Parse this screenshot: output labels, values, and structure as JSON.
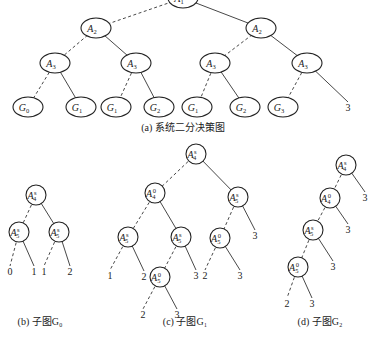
{
  "figure_a": {
    "caption": "(a) 系统二分决策图",
    "nodes": [
      {
        "id": "a_root",
        "var": "A",
        "sub": "1",
        "x": 183,
        "y": -2,
        "rx": 15,
        "ry": 10
      },
      {
        "id": "a_l",
        "var": "A",
        "sub": "2",
        "x": 96,
        "y": 28,
        "rx": 15,
        "ry": 10
      },
      {
        "id": "a_r",
        "var": "A",
        "sub": "2",
        "x": 261,
        "y": 28,
        "rx": 15,
        "ry": 10
      },
      {
        "id": "a_ll",
        "var": "A",
        "sub": "3",
        "x": 55,
        "y": 63,
        "rx": 15,
        "ry": 10
      },
      {
        "id": "a_lr",
        "var": "A",
        "sub": "3",
        "x": 136,
        "y": 63,
        "rx": 15,
        "ry": 10
      },
      {
        "id": "a_rl",
        "var": "A",
        "sub": "3",
        "x": 215,
        "y": 63,
        "rx": 15,
        "ry": 10
      },
      {
        "id": "a_rr",
        "var": "A",
        "sub": "3",
        "x": 307,
        "y": 63,
        "rx": 15,
        "ry": 10
      },
      {
        "id": "g1",
        "var": "G",
        "sub": "0",
        "x": 28,
        "y": 107,
        "rx": 15,
        "ry": 10
      },
      {
        "id": "g2",
        "var": "G",
        "sub": "1",
        "x": 81,
        "y": 107,
        "rx": 15,
        "ry": 10
      },
      {
        "id": "g3",
        "var": "G",
        "sub": "1",
        "x": 116,
        "y": 107,
        "rx": 15,
        "ry": 10
      },
      {
        "id": "g4",
        "var": "G",
        "sub": "2",
        "x": 159,
        "y": 107,
        "rx": 15,
        "ry": 10
      },
      {
        "id": "g5",
        "var": "G",
        "sub": "1",
        "x": 197,
        "y": 107,
        "rx": 15,
        "ry": 10
      },
      {
        "id": "g6",
        "var": "G",
        "sub": "2",
        "x": 245,
        "y": 107,
        "rx": 15,
        "ry": 10
      },
      {
        "id": "g7",
        "var": "G",
        "sub": "3",
        "x": 283,
        "y": 107,
        "rx": 15,
        "ry": 10
      }
    ],
    "leaves": [
      {
        "id": "a_t1",
        "text": "3",
        "x": 348,
        "y": 111
      }
    ],
    "edges": [
      {
        "from": "a_root",
        "to": "a_l",
        "style": "dashed"
      },
      {
        "from": "a_root",
        "to": "a_r",
        "style": "solid"
      },
      {
        "from": "a_l",
        "to": "a_ll",
        "style": "dashed"
      },
      {
        "from": "a_l",
        "to": "a_lr",
        "style": "solid"
      },
      {
        "from": "a_r",
        "to": "a_rl",
        "style": "dashed"
      },
      {
        "from": "a_r",
        "to": "a_rr",
        "style": "solid"
      },
      {
        "from": "a_ll",
        "to": "g1",
        "style": "dashed"
      },
      {
        "from": "a_ll",
        "to": "g2",
        "style": "solid"
      },
      {
        "from": "a_lr",
        "to": "g3",
        "style": "dashed"
      },
      {
        "from": "a_lr",
        "to": "g4",
        "style": "solid"
      },
      {
        "from": "a_rl",
        "to": "g5",
        "style": "dashed"
      },
      {
        "from": "a_rl",
        "to": "g6",
        "style": "solid"
      },
      {
        "from": "a_rr",
        "to": "g7",
        "style": "dashed"
      },
      {
        "from": "a_rr",
        "to": "a_t1",
        "style": "solid"
      }
    ]
  },
  "figure_b": {
    "caption": "(b) 子图G₀",
    "nodes": [
      {
        "id": "b_root",
        "var": "A",
        "sub": "4",
        "sup": "s",
        "x": 36,
        "y": 195,
        "r": 10
      },
      {
        "id": "b_l",
        "var": "A",
        "sub": "5",
        "sup": "s",
        "x": 19,
        "y": 232,
        "r": 10
      },
      {
        "id": "b_r",
        "var": "A",
        "sub": "5",
        "sup": "s",
        "x": 59,
        "y": 232,
        "r": 10
      }
    ],
    "leaves": [
      {
        "id": "b_t0",
        "text": "0",
        "x": 10,
        "y": 275
      },
      {
        "id": "b_t1",
        "text": "1",
        "x": 34,
        "y": 275
      },
      {
        "id": "b_t2",
        "text": "1",
        "x": 44,
        "y": 275
      },
      {
        "id": "b_t3",
        "text": "2",
        "x": 70,
        "y": 275
      }
    ],
    "edges": [
      {
        "from": "b_root",
        "to": "b_l",
        "style": "dashed"
      },
      {
        "from": "b_root",
        "to": "b_r",
        "style": "solid"
      },
      {
        "from": "b_l",
        "to": "b_t0",
        "style": "dashed"
      },
      {
        "from": "b_l",
        "to": "b_t1",
        "style": "solid"
      },
      {
        "from": "b_r",
        "to": "b_t2",
        "style": "dashed"
      },
      {
        "from": "b_r",
        "to": "b_t3",
        "style": "solid"
      }
    ]
  },
  "figure_c": {
    "caption": "(c) 子图G₁",
    "nodes": [
      {
        "id": "c_root",
        "var": "A",
        "sub": "4",
        "sup": "s",
        "x": 196,
        "y": 154,
        "r": 10
      },
      {
        "id": "c_l",
        "var": "A",
        "sub": "4",
        "sup": "0",
        "x": 155,
        "y": 193,
        "r": 10
      },
      {
        "id": "c_r",
        "var": "A",
        "sub": "5",
        "sup": "s",
        "x": 238,
        "y": 197,
        "r": 10
      },
      {
        "id": "c_ll",
        "var": "A",
        "sub": "5",
        "sup": "s",
        "x": 128,
        "y": 237,
        "r": 10
      },
      {
        "id": "c_lr",
        "var": "A",
        "sub": "5",
        "sup": "s",
        "x": 181,
        "y": 237,
        "r": 10
      },
      {
        "id": "c_rl",
        "var": "A",
        "sub": "5",
        "sup": "0",
        "x": 220,
        "y": 238,
        "r": 10
      },
      {
        "id": "c_lrl",
        "var": "A",
        "sub": "5",
        "sup": "0",
        "x": 160,
        "y": 277,
        "r": 10
      }
    ],
    "leaves": [
      {
        "id": "c_t1",
        "text": "1",
        "x": 110,
        "y": 279
      },
      {
        "id": "c_t2",
        "text": "2",
        "x": 144,
        "y": 280
      },
      {
        "id": "c_t3",
        "text": "3",
        "x": 196,
        "y": 279
      },
      {
        "id": "c_t4",
        "text": "2",
        "x": 205,
        "y": 279
      },
      {
        "id": "c_t5",
        "text": "3",
        "x": 240,
        "y": 279
      },
      {
        "id": "c_t6",
        "text": "3",
        "x": 255,
        "y": 239
      },
      {
        "id": "c_t7",
        "text": "2",
        "x": 143,
        "y": 318
      },
      {
        "id": "c_t8",
        "text": "3",
        "x": 177,
        "y": 318
      }
    ],
    "edges": [
      {
        "from": "c_root",
        "to": "c_l",
        "style": "dashed"
      },
      {
        "from": "c_root",
        "to": "c_r",
        "style": "solid"
      },
      {
        "from": "c_l",
        "to": "c_ll",
        "style": "dashed"
      },
      {
        "from": "c_l",
        "to": "c_lr",
        "style": "solid"
      },
      {
        "from": "c_r",
        "to": "c_rl",
        "style": "dashed"
      },
      {
        "from": "c_r",
        "to": "c_t6",
        "style": "solid"
      },
      {
        "from": "c_ll",
        "to": "c_t1",
        "style": "dashed"
      },
      {
        "from": "c_ll",
        "to": "c_t2",
        "style": "solid"
      },
      {
        "from": "c_lr",
        "to": "c_lrl",
        "style": "dashed"
      },
      {
        "from": "c_lr",
        "to": "c_t3",
        "style": "solid"
      },
      {
        "from": "c_rl",
        "to": "c_t4",
        "style": "dashed"
      },
      {
        "from": "c_rl",
        "to": "c_t5",
        "style": "solid"
      },
      {
        "from": "c_lrl",
        "to": "c_t7",
        "style": "dashed"
      },
      {
        "from": "c_lrl",
        "to": "c_t8",
        "style": "solid"
      }
    ]
  },
  "figure_d": {
    "caption": "(d) 子图G₂",
    "nodes": [
      {
        "id": "d_1",
        "var": "A",
        "sub": "4",
        "sup": "s",
        "x": 346,
        "y": 165,
        "r": 10
      },
      {
        "id": "d_2",
        "var": "A",
        "sub": "4",
        "sup": "0",
        "x": 330,
        "y": 198,
        "r": 10
      },
      {
        "id": "d_3",
        "var": "A",
        "sub": "5",
        "sup": "s",
        "x": 313,
        "y": 230,
        "r": 10
      },
      {
        "id": "d_4",
        "var": "A",
        "sub": "5",
        "sup": "0",
        "x": 298,
        "y": 267,
        "r": 10
      }
    ],
    "leaves": [
      {
        "id": "d_t1",
        "text": "3",
        "x": 365,
        "y": 201
      },
      {
        "id": "d_t2",
        "text": "3",
        "x": 348,
        "y": 233
      },
      {
        "id": "d_t3",
        "text": "3",
        "x": 333,
        "y": 270
      },
      {
        "id": "d_t4",
        "text": "2",
        "x": 287,
        "y": 307
      },
      {
        "id": "d_t5",
        "text": "3",
        "x": 312,
        "y": 307
      }
    ],
    "edges": [
      {
        "from": "d_1",
        "to": "d_2",
        "style": "dashed"
      },
      {
        "from": "d_1",
        "to": "d_t1",
        "style": "solid"
      },
      {
        "from": "d_2",
        "to": "d_3",
        "style": "dashed"
      },
      {
        "from": "d_2",
        "to": "d_t2",
        "style": "solid"
      },
      {
        "from": "d_3",
        "to": "d_4",
        "style": "dashed"
      },
      {
        "from": "d_3",
        "to": "d_t3",
        "style": "solid"
      },
      {
        "from": "d_4",
        "to": "d_t4",
        "style": "dashed"
      },
      {
        "from": "d_4",
        "to": "d_t5",
        "style": "solid"
      }
    ]
  },
  "captions_pos": {
    "a": {
      "x": 183,
      "y": 131
    },
    "b": {
      "x": 40,
      "y": 325
    },
    "c": {
      "x": 185,
      "y": 325
    },
    "d": {
      "x": 320,
      "y": 325
    }
  }
}
